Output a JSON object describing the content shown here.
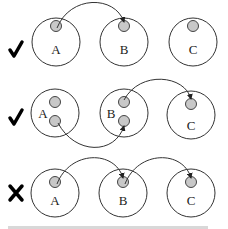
{
  "diagrams": [
    {
      "verdict": "check",
      "verdict_icon": "check-icon",
      "nodes": [
        {
          "label": "A",
          "inner_count": 1
        },
        {
          "label": "B",
          "inner_count": 1
        },
        {
          "label": "C",
          "inner_count": 1
        }
      ],
      "arrows": [
        {
          "from": "A",
          "to": "B"
        }
      ]
    },
    {
      "verdict": "check",
      "verdict_icon": "check-icon",
      "nodes": [
        {
          "label": "A",
          "inner_count": 2
        },
        {
          "label": "B",
          "inner_count": 2
        },
        {
          "label": "C",
          "inner_count": 1
        }
      ],
      "arrows": [
        {
          "from": "A",
          "to": "B"
        },
        {
          "from": "B",
          "to": "C"
        }
      ]
    },
    {
      "verdict": "cross",
      "verdict_icon": "cross-icon",
      "nodes": [
        {
          "label": "A",
          "inner_count": 1
        },
        {
          "label": "B",
          "inner_count": 1
        },
        {
          "label": "C",
          "inner_count": 1
        }
      ],
      "arrows": [
        {
          "from": "A",
          "to": "B"
        },
        {
          "from": "B",
          "to": "C"
        }
      ]
    }
  ]
}
